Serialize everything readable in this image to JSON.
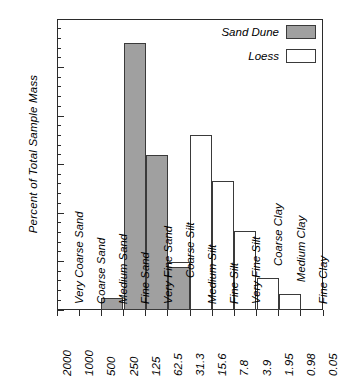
{
  "chart_data": {
    "type": "bar",
    "title": "",
    "subtitle": "",
    "xlabel": "",
    "ylabel": "Percent of Total Sample Mass",
    "ylim": [
      0,
      60
    ],
    "y_major_step": 10,
    "y_minor_step": 2,
    "grid": false,
    "legend_position": "top-right",
    "x_axis_type": "grain-size-boundaries-micrometers",
    "x_boundaries": [
      "2000",
      "1000",
      "500",
      "250",
      "125",
      "62.5",
      "31.3",
      "15.6",
      "7.8",
      "3.9",
      "1.95",
      "0.98",
      "0.05"
    ],
    "categories": [
      "Very Coarse Sand",
      "Coarse Sand",
      "Medium Sand",
      "Fine Sand",
      "Very Fine Sand",
      "Coarse Silt",
      "Medium Silt",
      "Fine Silt",
      "Very Fine Silt",
      "Coarse Clay",
      "Medium Clay",
      "Fine Clay"
    ],
    "series": [
      {
        "name": "Sand Dune",
        "color": "#a0a0a0",
        "values": [
          0,
          0,
          2.5,
          55,
          32,
          8.8,
          0,
          0,
          0,
          0,
          0,
          0
        ]
      },
      {
        "name": "Loess",
        "color": "#ffffff",
        "values": [
          0,
          0,
          0,
          0,
          1.5,
          10,
          36,
          26.7,
          16.3,
          6.5,
          3.3,
          0
        ]
      }
    ],
    "y_tick_labels": [
      "0",
      "10",
      "20",
      "30",
      "40",
      "50",
      "60"
    ],
    "annotations": []
  },
  "legend": {
    "items": [
      {
        "label": "Sand Dune",
        "swatch": "dune"
      },
      {
        "label": "Loess",
        "swatch": "loess"
      }
    ]
  }
}
